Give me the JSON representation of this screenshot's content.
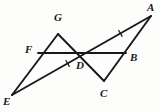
{
  "figure": {
    "kind": "geometry-diagram",
    "background_color": "#fdfdfc",
    "stroke_color": "#18181a",
    "label_color": "#18181a",
    "width": 161,
    "height": 112
  },
  "points": [
    {
      "id": "A",
      "label": "A",
      "x": 151,
      "y": 16,
      "label_x": 147,
      "label_y": 2,
      "name": "vertex-a"
    },
    {
      "id": "G",
      "label": "G",
      "x": 58,
      "y": 34,
      "label_x": 54,
      "label_y": 12,
      "name": "vertex-g"
    },
    {
      "id": "F",
      "label": "F",
      "x": 38,
      "y": 53,
      "label_x": 25,
      "label_y": 44,
      "name": "vertex-f"
    },
    {
      "id": "B",
      "label": "B",
      "x": 126,
      "y": 53,
      "label_x": 130,
      "label_y": 52,
      "name": "vertex-b"
    },
    {
      "id": "D",
      "label": "D",
      "x": 81,
      "y": 54,
      "label_x": 76,
      "label_y": 60,
      "name": "vertex-d"
    },
    {
      "id": "C",
      "label": "C",
      "x": 104,
      "y": 81,
      "label_x": 100,
      "label_y": 88,
      "name": "vertex-c"
    },
    {
      "id": "E",
      "label": "E",
      "x": 12,
      "y": 95,
      "label_x": 3,
      "label_y": 96,
      "name": "vertex-e"
    }
  ],
  "segments": [
    {
      "id": "EG",
      "from": "E",
      "to": "G",
      "name": "segment-e-g",
      "width": 1.9
    },
    {
      "id": "EA",
      "from": "E",
      "to": "A",
      "name": "segment-e-a",
      "width": 1.9
    },
    {
      "id": "GC",
      "from": "G",
      "to": "C",
      "name": "segment-g-c",
      "width": 1.9
    },
    {
      "id": "AC",
      "from": "A",
      "to": "C",
      "name": "segment-a-c",
      "width": 1.9
    },
    {
      "id": "FB",
      "from": "F",
      "to": "B",
      "name": "segment-f-b",
      "width": 1.9
    }
  ],
  "tick_marks": [
    {
      "id": "tick-ED",
      "on_segment": "EA",
      "t": 0.4,
      "name": "congruence-tick-segment-e-d"
    },
    {
      "id": "tick-DA",
      "on_segment": "EA",
      "t": 0.78,
      "name": "congruence-tick-segment-d-a"
    }
  ],
  "labels_text": {
    "A": "A",
    "B": "B",
    "C": "C",
    "D": "D",
    "E": "E",
    "F": "F",
    "G": "G"
  }
}
